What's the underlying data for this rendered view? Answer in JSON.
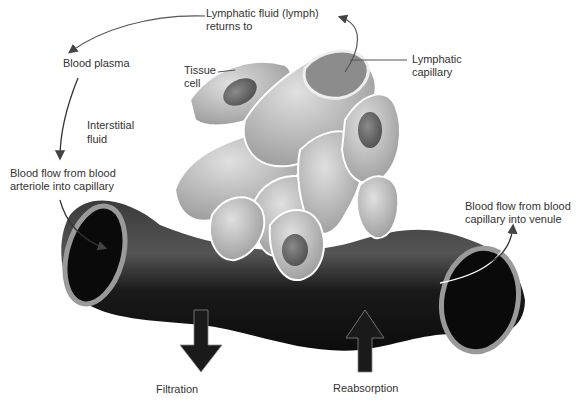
{
  "diagram": {
    "labels": {
      "lymph_line1": "Lymphatic fluid (lymph)",
      "lymph_line2": "returns to",
      "blood_plasma": "Blood plasma",
      "tissue_line1": "Tissue",
      "tissue_line2": "cell",
      "lymph_cap_line1": "Lymphatic",
      "lymph_cap_line2": "capillary",
      "interstitial_line1": "Interstitial",
      "interstitial_line2": "fluid",
      "arteriole_line1": "Blood flow from blood",
      "arteriole_line2": "arteriole into capillary",
      "venule_line1": "Blood flow from blood",
      "venule_line2": "capillary into venule",
      "filtration": "Filtration",
      "reabsorption": "Reabsorption"
    },
    "colors": {
      "vessel": "#1c1c1c",
      "vessel_rim": "#9a9a9a",
      "cells": "#b8b8b8",
      "nucleus": "#6e6e6e",
      "arrow": "#1a1a1a",
      "leader": "#555555"
    }
  }
}
